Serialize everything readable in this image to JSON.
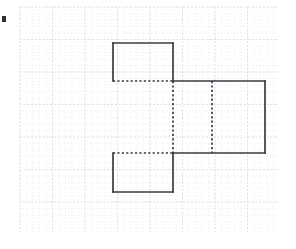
{
  "figure": {
    "kind": "geometry-net",
    "canvas": {
      "width": 296,
      "height": 249,
      "background": "#ffffff"
    },
    "colors": {
      "grid_minor": "#e8e8ee",
      "grid_major": "#dcdce4",
      "edge": "#3a3a42",
      "mark": "#2f2f36"
    },
    "grid": {
      "origin_x": 20,
      "origin_y": 7,
      "right_x": 278,
      "bottom_y": 232,
      "minor_spacing": 6.5,
      "major_spacing": 32.5,
      "minor_cols": 40,
      "minor_rows": 35,
      "major_cols": 8,
      "major_rows": 7,
      "style": "dotted"
    },
    "cell": {
      "size": 39
    },
    "faces": [
      {
        "name": "top-face",
        "x": 113,
        "y": 43,
        "w": 60,
        "h": 38
      },
      {
        "name": "front-face",
        "x": 173,
        "y": 81,
        "w": 39,
        "h": 72
      },
      {
        "name": "right-face",
        "x": 212,
        "y": 81,
        "w": 53,
        "h": 72
      },
      {
        "name": "bottom-face",
        "x": 113,
        "y": 153,
        "w": 60,
        "h": 39
      }
    ],
    "solid_edges": [
      {
        "name": "top-face-left-edge",
        "x1": 113,
        "y1": 43,
        "x2": 113,
        "y2": 81
      },
      {
        "name": "top-face-top-edge",
        "x1": 113,
        "y1": 43,
        "x2": 173,
        "y2": 43
      },
      {
        "name": "top-face-right-edge",
        "x1": 173,
        "y1": 43,
        "x2": 173,
        "y2": 81
      },
      {
        "name": "upper-right-top-edge",
        "x1": 173,
        "y1": 81,
        "x2": 265,
        "y2": 81
      },
      {
        "name": "right-face-right-edge",
        "x1": 265,
        "y1": 81,
        "x2": 265,
        "y2": 153
      },
      {
        "name": "lower-right-bottom-edge",
        "x1": 173,
        "y1": 153,
        "x2": 265,
        "y2": 153
      },
      {
        "name": "bottom-face-right-edge",
        "x1": 173,
        "y1": 153,
        "x2": 173,
        "y2": 192
      },
      {
        "name": "bottom-face-bottom-edge",
        "x1": 113,
        "y1": 192,
        "x2": 173,
        "y2": 192
      },
      {
        "name": "bottom-face-left-edge",
        "x1": 113,
        "y1": 153,
        "x2": 113,
        "y2": 192
      }
    ],
    "hidden_edges": [
      {
        "name": "fold-line-top",
        "x1": 113,
        "y1": 81,
        "x2": 173,
        "y2": 81
      },
      {
        "name": "fold-line-left-vertical",
        "x1": 173,
        "y1": 81,
        "x2": 173,
        "y2": 153
      },
      {
        "name": "fold-line-middle-vertical",
        "x1": 212,
        "y1": 81,
        "x2": 212,
        "y2": 153
      },
      {
        "name": "fold-line-bottom",
        "x1": 113,
        "y1": 153,
        "x2": 173,
        "y2": 153
      }
    ],
    "corner_mark": {
      "name": "left-edge-mark",
      "x": 2,
      "y": 16,
      "w": 4,
      "h": 6
    }
  }
}
